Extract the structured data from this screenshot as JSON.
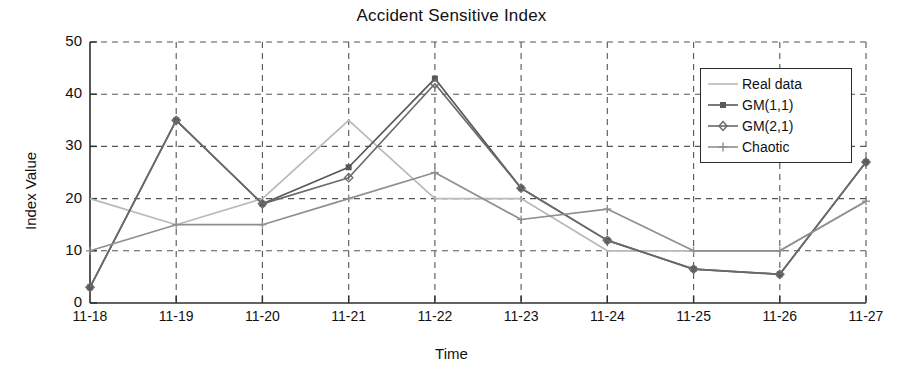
{
  "chart_data": {
    "type": "line",
    "title": "Accident Sensitive Index",
    "xlabel": "Time",
    "ylabel": "Index Value",
    "categories": [
      "11-18",
      "11-19",
      "11-20",
      "11-21",
      "11-22",
      "11-23",
      "11-24",
      "11-25",
      "11-26",
      "11-27"
    ],
    "ylim": [
      0,
      50
    ],
    "yticks": [
      0,
      10,
      20,
      30,
      40,
      50
    ],
    "grid": "dashed both axes",
    "legend_position": "top-right inside",
    "series": [
      {
        "name": "Real data",
        "color": "#b9b9b9",
        "marker": "none",
        "values": [
          20,
          15,
          20,
          35,
          20,
          20,
          10,
          10,
          10,
          19.5
        ]
      },
      {
        "name": "GM(1,1)",
        "color": "#585858",
        "marker": "square",
        "values": [
          3,
          35,
          19,
          26,
          43,
          22,
          12,
          6.5,
          5.5,
          27
        ]
      },
      {
        "name": "GM(2,1)",
        "color": "#6a6a6a",
        "marker": "diamond",
        "values": [
          3,
          35,
          19,
          24,
          42,
          22,
          12,
          6.5,
          5.5,
          27
        ]
      },
      {
        "name": "Chaotic",
        "color": "#8f8f8f",
        "marker": "plus",
        "values": [
          10,
          15,
          15,
          20,
          25,
          16,
          18,
          10,
          10,
          19.5
        ]
      }
    ]
  },
  "legend": {
    "items": [
      {
        "label": "Real data"
      },
      {
        "label": "GM(1,1)"
      },
      {
        "label": "GM(2,1)"
      },
      {
        "label": "Chaotic"
      }
    ]
  },
  "axis": {
    "y_tick_labels": [
      "50",
      "40",
      "30",
      "20",
      "10",
      "0"
    ],
    "x_tick_labels": [
      "11-18",
      "11-19",
      "11-20",
      "11-21",
      "11-22",
      "11-23",
      "11-24",
      "11-25",
      "11-26",
      "11-27"
    ]
  },
  "colors": {
    "axis": "#3a3a3a",
    "grid": "#4a4a4a",
    "background": "#ffffff"
  }
}
